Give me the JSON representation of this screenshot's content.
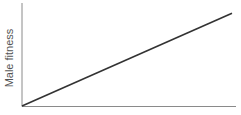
{
  "chart_data": {
    "type": "line",
    "title": "",
    "xlabel": "",
    "ylabel": "Male fitness",
    "x": [
      0,
      1
    ],
    "series": [
      {
        "name": "male fitness",
        "values": [
          0,
          0.9
        ]
      }
    ],
    "xlim": [
      0,
      1
    ],
    "ylim": [
      0,
      1
    ],
    "grid": false,
    "legend": "none",
    "ticks": "none"
  },
  "colors": {
    "axis": "#8a8a8a",
    "line": "#333333",
    "label": "#555555"
  }
}
